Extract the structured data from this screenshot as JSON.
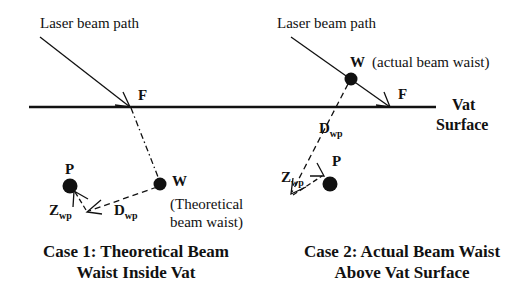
{
  "colors": {
    "ink": "#111111",
    "background": "#ffffff"
  },
  "surface": {
    "label_line1": "Vat",
    "label_line2": "Surface"
  },
  "case1": {
    "laser_label": "Laser beam path",
    "focus_label": "F",
    "waist_label": "W",
    "waist_desc_line1": "(Theoretical",
    "waist_desc_line2": "beam waist)",
    "point_label": "P",
    "d_label_main": "D",
    "d_label_sub": "wp",
    "z_label_main": "Z",
    "z_label_sub": "wp",
    "caption_line1": "Case 1: Theoretical Beam",
    "caption_line2": "Waist Inside Vat"
  },
  "case2": {
    "laser_label": "Laser beam path",
    "focus_label": "F",
    "waist_label": "W",
    "waist_desc": "(actual beam waist)",
    "point_label": "P",
    "d_label_main": "D",
    "d_label_sub": "wp",
    "z_label_main": "Z",
    "z_label_sub": "wp",
    "caption_line1": "Case 2: Actual Beam Waist",
    "caption_line2": "Above Vat Surface"
  }
}
